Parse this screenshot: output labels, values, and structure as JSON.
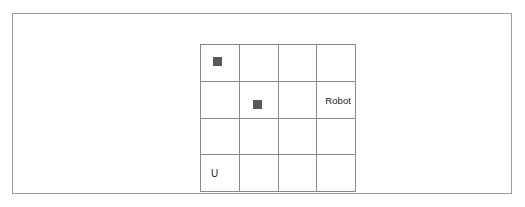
{
  "canvas": {
    "width": 525,
    "height": 207,
    "background": "#ffffff"
  },
  "frame": {
    "border_color": "#9d9d9d"
  },
  "grid": {
    "rows": 4,
    "columns": 4,
    "line_color": "#8a8a8a",
    "marker_color": "#585858",
    "cells": [
      {
        "id": "r1c1",
        "row": 1,
        "col": 1,
        "content": "block",
        "label": ""
      },
      {
        "id": "r1c2",
        "row": 1,
        "col": 2,
        "content": "empty",
        "label": ""
      },
      {
        "id": "r1c3",
        "row": 1,
        "col": 3,
        "content": "empty",
        "label": ""
      },
      {
        "id": "r1c4",
        "row": 1,
        "col": 4,
        "content": "empty",
        "label": ""
      },
      {
        "id": "r2c1",
        "row": 2,
        "col": 1,
        "content": "empty",
        "label": ""
      },
      {
        "id": "r2c2",
        "row": 2,
        "col": 2,
        "content": "block",
        "label": ""
      },
      {
        "id": "r2c3",
        "row": 2,
        "col": 3,
        "content": "empty",
        "label": ""
      },
      {
        "id": "r2c4",
        "row": 2,
        "col": 4,
        "content": "text",
        "label": "Robot"
      },
      {
        "id": "r3c1",
        "row": 3,
        "col": 1,
        "content": "empty",
        "label": ""
      },
      {
        "id": "r3c2",
        "row": 3,
        "col": 2,
        "content": "empty",
        "label": ""
      },
      {
        "id": "r3c3",
        "row": 3,
        "col": 3,
        "content": "empty",
        "label": ""
      },
      {
        "id": "r3c4",
        "row": 3,
        "col": 4,
        "content": "empty",
        "label": ""
      },
      {
        "id": "r4c1",
        "row": 4,
        "col": 1,
        "content": "text",
        "label": "U"
      },
      {
        "id": "r4c2",
        "row": 4,
        "col": 2,
        "content": "empty",
        "label": ""
      },
      {
        "id": "r4c3",
        "row": 4,
        "col": 3,
        "content": "empty",
        "label": ""
      },
      {
        "id": "r4c4",
        "row": 4,
        "col": 4,
        "content": "empty",
        "label": ""
      }
    ]
  }
}
